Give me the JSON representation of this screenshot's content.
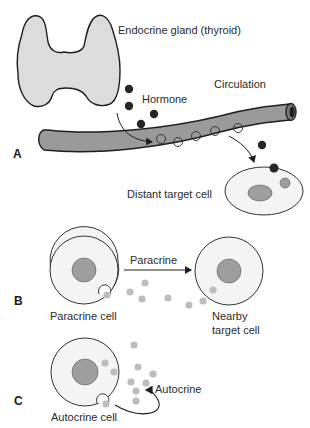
{
  "figure": {
    "panels": {
      "a": {
        "letter": "A",
        "labels": {
          "gland": "Endocrine gland (thyroid)",
          "hormone": "Hormone",
          "circulation": "Circulation",
          "target": "Distant target cell"
        }
      },
      "b": {
        "letter": "B",
        "labels": {
          "arrow": "Paracrine",
          "source": "Paracrine cell",
          "target_line1": "Nearby",
          "target_line2": "target cell"
        }
      },
      "c": {
        "letter": "C",
        "labels": {
          "arrow": "Autocrine",
          "source": "Autocrine cell"
        }
      }
    },
    "colors": {
      "gland_fill": "#dcdcdc",
      "vessel_fill": "#9a9a9a",
      "hormone_dot": "#262626",
      "nucleus": "#9e9e9e",
      "signal_dot": "#bdbdbd",
      "cell_fill": "#f4f4f4",
      "outline": "#1e1e1e"
    }
  }
}
